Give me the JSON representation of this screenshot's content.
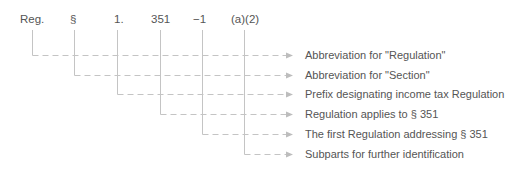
{
  "citation_parts": [
    {
      "label": "Reg.",
      "x": 20
    },
    {
      "label": "§",
      "x": 70
    },
    {
      "label": "1.",
      "x": 114
    },
    {
      "label": "351",
      "x": 151
    },
    {
      "label": "−1",
      "x": 193
    },
    {
      "label": "(a)(2)",
      "x": 231
    }
  ],
  "descriptions": [
    {
      "text": "Abbreviation for \"Regulation\""
    },
    {
      "text": "Abbreviation for \"Section\""
    },
    {
      "text": "Prefix designating income tax Regulation"
    },
    {
      "text": "Regulation applies to § 351"
    },
    {
      "text": "The first Regulation addressing § 351"
    },
    {
      "text": "Subparts for further identification"
    }
  ],
  "colors": {
    "text": "#555555",
    "line": "#bbbbbb",
    "arrow": "#bbbbbb"
  }
}
